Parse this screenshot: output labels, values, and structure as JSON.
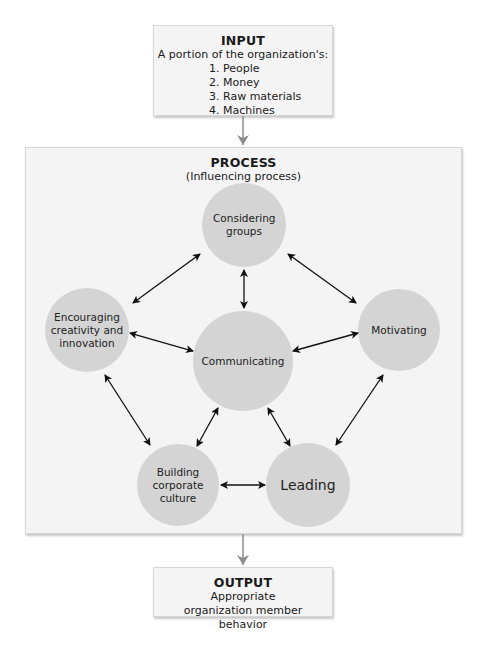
{
  "input": {
    "title": "INPUT",
    "subtitle": "A portion of the organization's:",
    "items": [
      "1. People",
      "2. Money",
      "3. Raw materials",
      "4. Machines"
    ]
  },
  "process": {
    "title": "PROCESS",
    "subtitle": "(Influencing process)",
    "nodes": {
      "considering_groups": "Considering groups",
      "encouraging": "Encouraging creativity and innovation",
      "communicating": "Communicating",
      "motivating": "Motivating",
      "building_culture": "Building corporate culture",
      "leading": "Leading"
    }
  },
  "output": {
    "title": "OUTPUT",
    "description": "Appropriate organization member behavior"
  },
  "colors": {
    "box_fill": "#f4f4f4",
    "circle_fill": "#d4d4d4",
    "flow_arrow": "#8c8c8c",
    "link_arrow": "#111111"
  }
}
